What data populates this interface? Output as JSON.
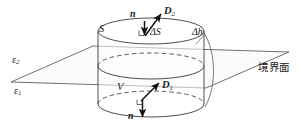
{
  "figure": {
    "type": "physics-diagram",
    "colors": {
      "stroke": "#3a3a3a",
      "arrow": "#1a1a1a",
      "plane_fill": "#fbfbfb",
      "cylinder_fill": "#ffffff",
      "background": "#ffffff"
    }
  },
  "labels": {
    "eps_upper": "ε",
    "eps_upper_sub": "2",
    "eps_lower": "ε",
    "eps_lower_sub": "1",
    "surface_S": "S",
    "volume_V": "V",
    "delta_S": "ΔS",
    "delta_h": "Δh",
    "normal_top": "n",
    "normal_bottom": "n",
    "flux_top": "D",
    "flux_top_sub": "2",
    "flux_bottom": "D",
    "flux_bottom_sub": "1",
    "boundary_surface": "境界面"
  },
  "geometry": {
    "plane": {
      "left_vertex": [
        11,
        82
      ],
      "bottom_vertex": [
        93,
        46
      ],
      "right_vertex": [
        289,
        52
      ],
      "top_vertex": [
        206,
        88
      ]
    },
    "cylinder": {
      "center_x": 151,
      "radius_x": 53,
      "radius_y": 13,
      "top_y": 31,
      "bottom_y": 104,
      "mid_ellipse_y": 66
    },
    "arrows": {
      "n_top": {
        "from": [
          144,
          22
        ],
        "to": [
          144,
          36
        ]
      },
      "D2_top": {
        "from": [
          144,
          36
        ],
        "to": [
          160,
          15
        ]
      },
      "n_bottom": {
        "from": [
          143,
          100
        ],
        "to": [
          143,
          117
        ]
      },
      "D1_bottom": {
        "from": [
          143,
          100
        ],
        "to": [
          158,
          83
        ]
      }
    }
  }
}
